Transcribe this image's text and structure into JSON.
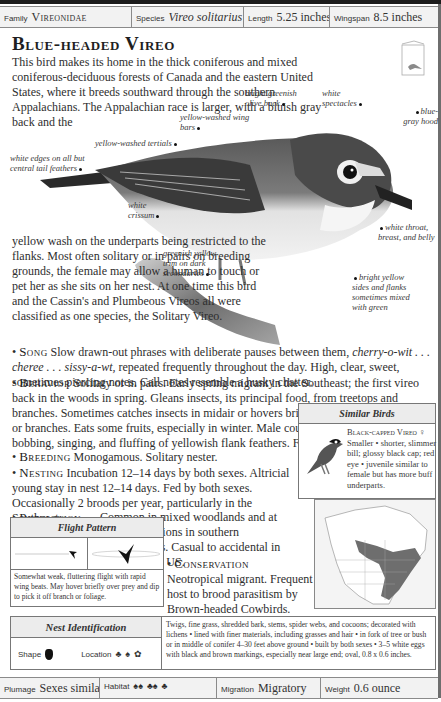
{
  "header": {
    "family_label": "Family",
    "family_value": "Vireonidae",
    "species_label": "Species",
    "species_value": "Vireo solitarius",
    "length_label": "Length",
    "length_value": "5.25 inches",
    "wingspan_label": "Wingspan",
    "wingspan_value": "8.5 inches"
  },
  "title": "Blue-headed Vireo",
  "intro": {
    "paragraph1": "This bird makes its home in the thick coniferous and mixed coniferous-deciduous forests of Canada and the eastern United States, where it breeds southward through the southern Appalachians. The Appalachian race is larger, with a bluish gray back and the",
    "paragraph2": "yellow wash on the underparts being restricted to the flanks. Most often solitary or in pairs on breeding grounds, the female may allow a human to touch or pet her as she sits on her nest. At one time this bird and the Cassin's and Plumbeous Vireos all were classified as one species, the Solitary Vireo."
  },
  "bird_labels": {
    "back": "bright greenish olive back",
    "spectacles": "white spectacles",
    "hood": "blue-gray hood",
    "wing_bars": "yellow-washed wing bars",
    "tertials": "yellow-washed tertials",
    "tail": "white edges on all but central tail feathers",
    "crissum": "white crissum",
    "throat": "white throat, breast, and belly",
    "secondaries": "greenish yellow trim on dark secondaries",
    "flanks": "bright yellow sides and flanks sometimes mixed with green"
  },
  "accounts": {
    "song_head": "Song",
    "song_text": "Slow drawn-out phrases with deliberate pauses between them, ",
    "song_phrase": "cherry-o-wit . . . cheree . . . sissy-a-wt,",
    "song_text2": " repeated frequently throughout the day. High, clear, sweet, sometimes piercing notes. Call notes resemble a husky chatter.",
    "behavior_head": "Behavior",
    "behavior_text": "Solitary or in pairs. Early spring migrant in the Southeast; the first vireo back in the woods in spring. Gleans insects, its principal food, from treetops and branches. Sometimes catches insects in midair or hovers briefly to pick them off foliage or branches. Eats some fruits, especially in winter. Male courts female with much bobbing, singing, and fluffing of yellowish flank feathers. Fairly tame.",
    "breeding_head": "Breeding",
    "breeding_text": "Monogamous. Solitary nester.",
    "nesting_head": "Nesting",
    "nesting_text": "Incubation 12–14 days by both sexes. Altricial young stay in nest 12–14 days. Fed by both sexes. Occasionally 2 broods per year, particularly in the Southeast.",
    "population_head": "Population",
    "population_text": "Common in mixed woodlands and at higher elevations in southern Appalachians. Casual to accidental in southwestern US.",
    "conservation_head": "Conservation",
    "conservation_text": "Neotropical migrant. Frequent host to brood parasitism by Brown-headed Cowbirds."
  },
  "similar_birds": {
    "title": "Similar Birds",
    "name": "Black-capped Vireo",
    "sex_symbol": "♀",
    "description": "Smaller • shorter, slimmer bill; glossy black cap; red eye • juvenile similar to female but has more buff underparts."
  },
  "flight_pattern": {
    "title": "Flight Pattern",
    "description": "Somewhat weak, fluttering flight with rapid wing beats. May hover briefly over prey and dip to pick it off branch or foliage."
  },
  "nest_identification": {
    "title": "Nest Identification",
    "shape_label": "Shape",
    "location_label": "Location",
    "description": "Twigs, fine grass, shredded bark, stems, spider webs, and cocoons; decorated with lichens • lined with finer materials, including grasses and hair • in fork of tree or bush or in middle of conifer 4–30 feet above ground • built by both sexes • 3–5 white eggs with black and brown markings, especially near large end; oval, 0.8 x 0.6 inches."
  },
  "footer": {
    "plumage_label": "Plumage",
    "plumage_value": "Sexes similar",
    "habitat_label": "Habitat",
    "migration_label": "Migration",
    "migration_value": "Migratory",
    "weight_label": "Weight",
    "weight_value": "0.6 ounce"
  },
  "colors": {
    "range_fill": "#6e6e6e",
    "panel_header": "#ececec",
    "rule": "#1c1c1c"
  }
}
